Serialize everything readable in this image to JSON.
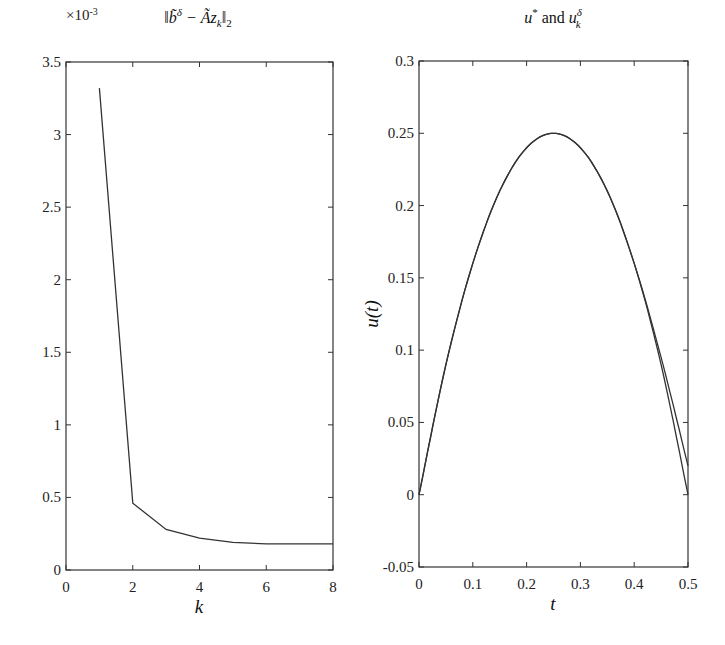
{
  "chart_data": [
    {
      "type": "line",
      "title": "||b̃^δ − Ãz_k||_2",
      "title_parts": {
        "main": "‖b̃",
        "sup": "δ",
        "mid": " − Ãz",
        "sub": "k",
        "end": "‖",
        "sub2": "2"
      },
      "xlabel": "k",
      "ylabel": "",
      "y_multiplier_label": "×10",
      "y_multiplier_exp": "-3",
      "xlim": [
        0,
        8
      ],
      "ylim": [
        0,
        3.5
      ],
      "xticks": [
        0,
        2,
        4,
        6,
        8
      ],
      "xtick_labels": [
        "0",
        "2",
        "4",
        "6",
        "8"
      ],
      "yticks": [
        0,
        0.5,
        1,
        1.5,
        2,
        2.5,
        3,
        3.5
      ],
      "ytick_labels": [
        "0",
        "0.5",
        "1",
        "1.5",
        "2",
        "2.5",
        "3",
        "3.5"
      ],
      "grid": false,
      "series": [
        {
          "name": "residual norm (×10^-3)",
          "x": [
            1,
            2,
            3,
            4,
            5,
            6,
            7,
            8
          ],
          "y": [
            3.32,
            0.46,
            0.28,
            0.22,
            0.19,
            0.18,
            0.18,
            0.18
          ]
        }
      ]
    },
    {
      "type": "line",
      "title": "u* and u_k^δ",
      "title_parts": {
        "u1": "u",
        "sup1": "*",
        "and": " and ",
        "u2": "u",
        "sup2": "δ",
        "sub2": "k"
      },
      "xlabel": "t",
      "ylabel": "u(t)",
      "xlim": [
        0,
        0.5
      ],
      "ylim": [
        -0.05,
        0.3
      ],
      "xticks": [
        0,
        0.1,
        0.2,
        0.3,
        0.4,
        0.5
      ],
      "xtick_labels": [
        "0",
        "0.1",
        "0.2",
        "0.3",
        "0.4",
        "0.5"
      ],
      "yticks": [
        -0.05,
        0,
        0.05,
        0.1,
        0.15,
        0.2,
        0.25,
        0.3
      ],
      "ytick_labels": [
        "-0.05",
        "0",
        "0.05",
        "0.1",
        "0.15",
        "0.2",
        "0.25",
        "0.3"
      ],
      "grid": false,
      "series": [
        {
          "name": "u*",
          "x": [
            0,
            0.05,
            0.1,
            0.15,
            0.2,
            0.25,
            0.3,
            0.35,
            0.4,
            0.45,
            0.5
          ],
          "y": [
            0,
            0.09,
            0.16,
            0.21,
            0.24,
            0.25,
            0.24,
            0.21,
            0.16,
            0.09,
            0.0
          ]
        },
        {
          "name": "u_k^δ",
          "x": [
            0,
            0.05,
            0.1,
            0.15,
            0.2,
            0.25,
            0.3,
            0.35,
            0.4,
            0.45,
            0.5
          ],
          "y": [
            0,
            0.09,
            0.16,
            0.21,
            0.24,
            0.25,
            0.24,
            0.21,
            0.16,
            0.095,
            0.02
          ]
        }
      ]
    }
  ]
}
